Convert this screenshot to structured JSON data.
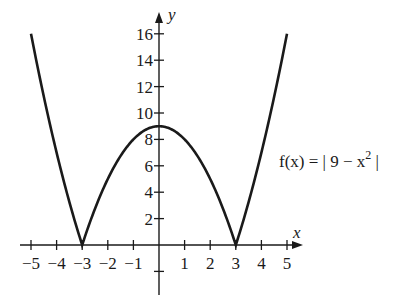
{
  "chart_data": {
    "type": "line",
    "title": "",
    "xlabel": "x",
    "ylabel": "y",
    "xlim": [
      -5,
      5
    ],
    "ylim": [
      -2,
      17
    ],
    "grid": false,
    "x_ticks": [
      -5,
      -4,
      -3,
      -2,
      -1,
      1,
      2,
      3,
      4,
      5
    ],
    "x_tick_labels": [
      "-5",
      "-4",
      "-3",
      "-2",
      "-1",
      "1",
      "2",
      "3",
      "4",
      "5"
    ],
    "y_ticks": [
      2,
      4,
      6,
      8,
      10,
      12,
      14,
      16
    ],
    "y_tick_labels": [
      "2",
      "4",
      "6",
      "8",
      "10",
      "12",
      "14",
      "16"
    ],
    "series": [
      {
        "name": "f(x) = |9 - x^2|",
        "x": [
          -5,
          -4.5,
          -4,
          -3.5,
          -3,
          -2.5,
          -2,
          -1.5,
          -1,
          -0.5,
          0,
          0.5,
          1,
          1.5,
          2,
          2.5,
          3,
          3.5,
          4,
          4.5,
          5
        ],
        "values": [
          16,
          11.25,
          7,
          3.25,
          0,
          2.75,
          5,
          6.75,
          8,
          8.75,
          9,
          8.75,
          8,
          6.75,
          5,
          2.75,
          0,
          3.25,
          7,
          11.25,
          16
        ]
      }
    ],
    "annotations": [
      {
        "text_prefix": "f(x) = | 9 − x",
        "superscript": "2",
        "text_suffix": " |",
        "position": "right of curve near y≈6"
      }
    ],
    "legend": "none"
  },
  "labels": {
    "x_axis": "x",
    "y_axis": "y",
    "func_prefix": "f(x) = | 9 − x",
    "func_sup": "2",
    "func_suffix": " |"
  },
  "colors": {
    "curve": "#1a1a1a",
    "axis": "#1a1a1a",
    "background": "#ffffff"
  }
}
